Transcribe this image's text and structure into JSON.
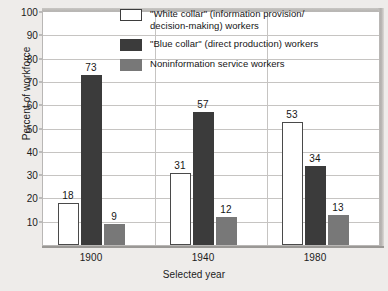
{
  "chart_data": {
    "type": "bar",
    "title": "",
    "xlabel": "Selected year",
    "ylabel": "Percent of workforce",
    "categories": [
      "1900",
      "1940",
      "1980"
    ],
    "ylim": [
      0,
      100
    ],
    "yticks": [
      10,
      20,
      30,
      40,
      50,
      60,
      70,
      80,
      90,
      100
    ],
    "grid": true,
    "legend_position": "top-center",
    "series": [
      {
        "name": "\"White collar\" (information provision/decision-making) workers",
        "name_line1": "\"White collar\" (information provision/",
        "name_line2": "decision-making) workers",
        "swatch": "white",
        "color": "#ffffff",
        "values": [
          18,
          31,
          53
        ]
      },
      {
        "name": "\"Blue collar\" (direct production) workers",
        "name_line1": "\"Blue collar\" (direct production) workers",
        "name_line2": "",
        "swatch": "dark",
        "color": "#3b3b3b",
        "values": [
          73,
          57,
          34
        ]
      },
      {
        "name": "Noninformation service workers",
        "name_line1": "Noninformation service workers",
        "name_line2": "",
        "swatch": "gray",
        "color": "#787878",
        "values": [
          9,
          12,
          13
        ]
      }
    ]
  },
  "axis": {
    "ytick_labels": [
      "100",
      "90",
      "80",
      "70",
      "60",
      "50",
      "40",
      "30",
      "20",
      "10"
    ],
    "xtick_labels": [
      "1900",
      "1940",
      "1980"
    ]
  },
  "colors": {
    "background": "#eeecea",
    "plot_background": "#ffffff",
    "gridline": "#c6c4c2",
    "axis": "#9a9895",
    "text": "#1b1b1b"
  }
}
